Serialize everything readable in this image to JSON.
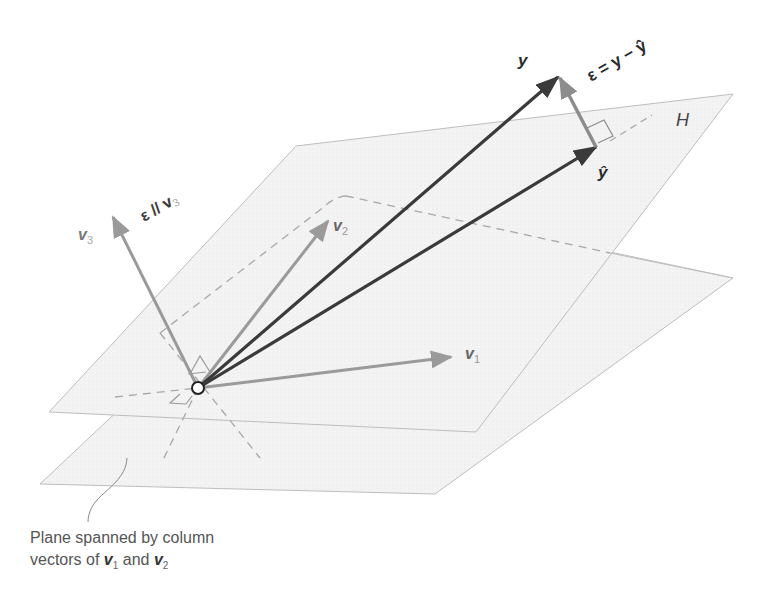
{
  "figure": {
    "colors": {
      "plane_fill": "#f1f1f1",
      "plane_edge": "#bdbdbd",
      "dashed": "#a8a8a8",
      "y_vectors": "#3a3a3a",
      "basis_vectors": "#9a9a9a",
      "epsilon_vector": "#8c8c8c",
      "origin_fill": "#ffffff",
      "origin_stroke": "#222222"
    },
    "planes": [
      {
        "name": "H",
        "label": "H",
        "points": [
          [
            296,
            146
          ],
          [
            733,
            94
          ],
          [
            476,
            432
          ],
          [
            49,
            412
          ]
        ]
      },
      {
        "name": "span-v1-v2",
        "points": [
          [
            346,
            196
          ],
          [
            733,
            278
          ],
          [
            435,
            494
          ],
          [
            40,
            484
          ]
        ]
      }
    ],
    "origin": [
      198,
      388
    ],
    "vectors": [
      {
        "name": "y",
        "label": "y",
        "tip": [
          558,
          77
        ]
      },
      {
        "name": "y-hat",
        "label": "ŷ",
        "tip": [
          596,
          147
        ]
      },
      {
        "name": "v1",
        "label": "v",
        "subscript": "1",
        "tip": [
          451,
          357
        ]
      },
      {
        "name": "v2",
        "label": "v",
        "subscript": "2",
        "tip": [
          328,
          221
        ]
      },
      {
        "name": "v3",
        "label": "v",
        "subscript": "3",
        "tip": [
          113,
          217
        ]
      },
      {
        "name": "epsilon",
        "label": "ε = y − ŷ",
        "from": [
          596,
          147
        ],
        "tip": [
          560,
          78
        ]
      }
    ],
    "labels": {
      "y": "y",
      "y_hat": "ŷ",
      "H": "H",
      "v1": "v",
      "v1_sub": "1",
      "v2": "v",
      "v2_sub": "2",
      "v3": "v",
      "v3_sub": "3",
      "epsilon_eq_left": "ε = y − ",
      "epsilon_eq_right": "ŷ",
      "epsilon_parallel": "ε // v",
      "epsilon_parallel_sub": "3"
    },
    "caption": {
      "line1": "Plane spanned by column",
      "line2_prefix": "vectors of ",
      "v1": "v",
      "v1_sub": "1",
      "and": " and ",
      "v2": "v",
      "v2_sub": "2"
    }
  }
}
